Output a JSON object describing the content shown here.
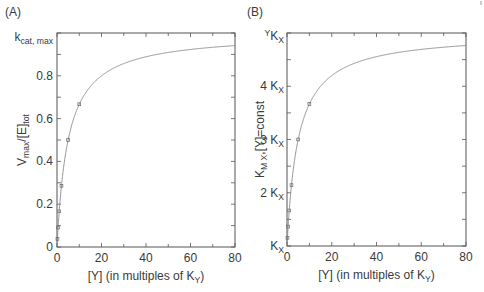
{
  "chart_data": [
    {
      "panel_label": "(A)",
      "type": "line",
      "xlabel": "[Y] (in multiples of K",
      "xlabel_sub": "Y",
      "xlabel_end": ")",
      "ylabel_main": "V",
      "ylabel_sub1": "max",
      "ylabel_mid": "/[E]",
      "ylabel_sub2": "tot",
      "xlim": [
        0,
        80
      ],
      "ylim": [
        0,
        1.0
      ],
      "x_ticks": [
        "0",
        "20",
        "40",
        "60",
        "80"
      ],
      "y_ticks": [
        "0",
        "0.2",
        "0.4",
        "0.6",
        "0.8"
      ],
      "y_top_label_main": "k",
      "y_top_label_sub": "cat, max",
      "curve": {
        "formula": "Y/(Y+5)",
        "x": [
          0,
          1,
          2,
          5,
          10,
          20,
          30,
          40,
          50,
          60,
          70,
          80
        ],
        "y": [
          0,
          0.167,
          0.286,
          0.5,
          0.667,
          0.8,
          0.857,
          0.889,
          0.909,
          0.923,
          0.933,
          0.941
        ]
      },
      "points": {
        "x": [
          0.2,
          0.5,
          1,
          2,
          5,
          10
        ],
        "y": [
          0.038,
          0.091,
          0.167,
          0.286,
          0.5,
          0.667
        ]
      }
    },
    {
      "panel_label": "(B)",
      "type": "line",
      "xlabel": "[Y] (in multiples of K",
      "xlabel_sub": "Y",
      "xlabel_end": ")",
      "ylabel_main": "K",
      "ylabel_sub1": "M X",
      "ylabel_mid": ",[Y]=const",
      "xlim": [
        0,
        80
      ],
      "ylim": [
        1,
        5
      ],
      "y_unit": "K_X",
      "x_ticks": [
        "0",
        "20",
        "40",
        "60",
        "80"
      ],
      "y_ticks": [
        "K",
        "2 K",
        "3 K",
        "4 K"
      ],
      "y_tick_sub": "X",
      "y_top_label_pre": "Y",
      "y_top_label_main": "K",
      "y_top_label_sub": "X",
      "curve": {
        "formula": "1+4*Y/(Y+5)",
        "x": [
          0,
          1,
          2,
          5,
          10,
          20,
          30,
          40,
          50,
          60,
          70,
          80
        ],
        "y": [
          1,
          1.667,
          2.143,
          3.0,
          3.667,
          4.2,
          4.429,
          4.556,
          4.636,
          4.692,
          4.733,
          4.765
        ]
      },
      "points": {
        "x": [
          0.2,
          0.5,
          1,
          2,
          5,
          10
        ],
        "y": [
          1.154,
          1.364,
          1.667,
          2.143,
          3.0,
          3.667
        ]
      }
    }
  ]
}
